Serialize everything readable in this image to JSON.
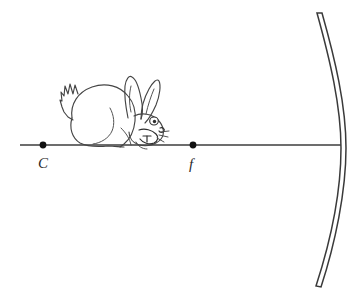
{
  "diagram": {
    "kind": "optics-ray-diagram",
    "background_color": "#ffffff",
    "canvas": {
      "width": 361,
      "height": 299
    },
    "line_color": "#3d3d3d",
    "sketch_color": "#454545",
    "label_color": "#2a2a2a"
  },
  "axis": {
    "name": "principal-axis",
    "x_start": 20,
    "x_end": 341,
    "y": 145
  },
  "points": [
    {
      "id": "center-of-curvature",
      "label": "C",
      "x": 43,
      "y": 145,
      "label_x": 38,
      "label_y": 168,
      "dot_radius": 3.4
    },
    {
      "id": "focal-point",
      "label": "f",
      "x": 193,
      "y": 145,
      "label_x": 189,
      "label_y": 169,
      "dot_radius": 3.4
    }
  ],
  "mirror": {
    "name": "concave-mirror",
    "top_x": 317,
    "top_y": 13,
    "bottom_x": 316,
    "bottom_y": 286,
    "vertex_x": 341,
    "vertex_y": 148,
    "thickness": 5,
    "stroke_color": "#3a3a3a",
    "fill_color": "#ffffff"
  },
  "object": {
    "name": "rabbit",
    "description": "hand drawn crouching rabbit facing right, sitting on the principal axis",
    "bounds": {
      "x": 58,
      "y": 70,
      "width": 112,
      "height": 78
    }
  }
}
